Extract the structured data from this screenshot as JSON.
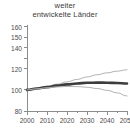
{
  "chart_data": {
    "type": "line",
    "title": "weiter entwickelte Länder",
    "title_lines": [
      "weiter",
      "entwickelte Länder"
    ],
    "xlabel": "",
    "ylabel": "",
    "xlim": [
      2000,
      2050
    ],
    "ylim": [
      80,
      160
    ],
    "yticks": [
      80,
      100,
      120,
      130,
      140,
      150,
      160
    ],
    "ytick_labels": [
      "80",
      "100",
      "120",
      "",
      "140",
      "150",
      "160"
    ],
    "xticks": [
      2000,
      2010,
      2020,
      2030,
      2040,
      2050
    ],
    "xtick_labels": [
      "2000",
      "2010",
      "2020",
      "2030",
      "2040",
      "2050"
    ],
    "x_minor_ticks": [
      2005,
      2015,
      2025,
      2035,
      2045
    ],
    "grid": false,
    "legend": "none",
    "x": [
      2000,
      2005,
      2010,
      2015,
      2020,
      2025,
      2030,
      2035,
      2040,
      2045,
      2050
    ],
    "series": [
      {
        "name": "hohe Variante",
        "color": "#b4b4b4",
        "width": 1.0,
        "values": [
          100.0,
          101.6,
          103.4,
          105.4,
          107.6,
          109.9,
          112.2,
          114.3,
          116.1,
          117.7,
          119.0
        ]
      },
      {
        "name": "mittlere Variante",
        "color": "#3c3c3c",
        "width": 2.6,
        "values": [
          100.0,
          101.3,
          102.6,
          104.0,
          105.2,
          106.1,
          106.7,
          106.9,
          106.8,
          106.5,
          106.0
        ]
      },
      {
        "name": "niedrige Variante",
        "color": "#b4b4b4",
        "width": 1.0,
        "values": [
          100.0,
          101.0,
          102.0,
          102.8,
          103.2,
          103.1,
          102.5,
          101.3,
          99.6,
          97.2,
          94.2
        ]
      }
    ]
  },
  "axes": {
    "spine_color": "#8c8c8c",
    "tick_color": "#8c8c8c",
    "label_color": "#4a4a4a"
  }
}
